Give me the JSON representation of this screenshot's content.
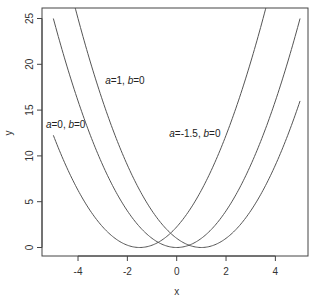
{
  "chart_data": {
    "type": "line",
    "title": "",
    "xlabel": "x",
    "ylabel": "y",
    "xlim": [
      -5.4,
      5.4
    ],
    "ylim": [
      -1.0,
      26.0
    ],
    "grid": false,
    "legend": "none",
    "x_ticks": [
      -4,
      -2,
      0,
      2,
      4
    ],
    "x_tick_labels": [
      "-4",
      "-2",
      "0",
      "2",
      "4"
    ],
    "y_ticks": [
      0,
      5,
      10,
      15,
      20,
      25
    ],
    "y_tick_labels": [
      "0",
      "5",
      "10",
      "15",
      "20",
      "25"
    ],
    "line_color": "#555555",
    "series": [
      {
        "name": "a=0, b=0",
        "formula": "(x+1.5)^2",
        "center": -1.5,
        "x_range": [
          -5,
          5
        ]
      },
      {
        "name": "a=-1.5, b=0",
        "formula": "x^2",
        "center": 0,
        "x_range": [
          -5,
          5
        ]
      },
      {
        "name": "a=1, b=0",
        "formula": "(x-1)^2",
        "center": 1,
        "x_range": [
          -5,
          5
        ]
      }
    ],
    "annotations": [
      {
        "a": "0",
        "b": "0",
        "x": -5.3,
        "y": 13.0
      },
      {
        "a": "1",
        "b": "0",
        "x": -2.9,
        "y": 17.9
      },
      {
        "a": "-1.5",
        "b": "0",
        "x": -0.3,
        "y": 12.1
      }
    ]
  },
  "labels": {
    "a_sym": "a",
    "b_sym": "b",
    "eq": "=",
    "sep": ", "
  }
}
